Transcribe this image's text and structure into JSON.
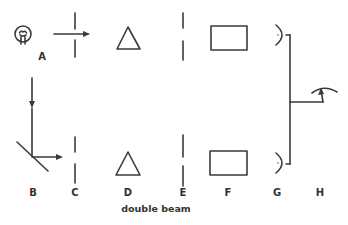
{
  "diagram": {
    "caption": "double beam",
    "labels": {
      "A": "A",
      "B": "B",
      "C": "C",
      "D": "D",
      "E": "E",
      "F": "F",
      "G": "G",
      "H": "H"
    },
    "components": [
      {
        "id": "A",
        "name": "light source (lamp)"
      },
      {
        "id": "B",
        "name": "beam splitter / mirror"
      },
      {
        "id": "C",
        "name": "entrance slit"
      },
      {
        "id": "D",
        "name": "prism"
      },
      {
        "id": "E",
        "name": "exit slit"
      },
      {
        "id": "F",
        "name": "sample cell"
      },
      {
        "id": "G",
        "name": "detector"
      },
      {
        "id": "H",
        "name": "meter"
      }
    ],
    "colors": {
      "line": "#3a3a3a",
      "background": "#ffffff"
    }
  }
}
